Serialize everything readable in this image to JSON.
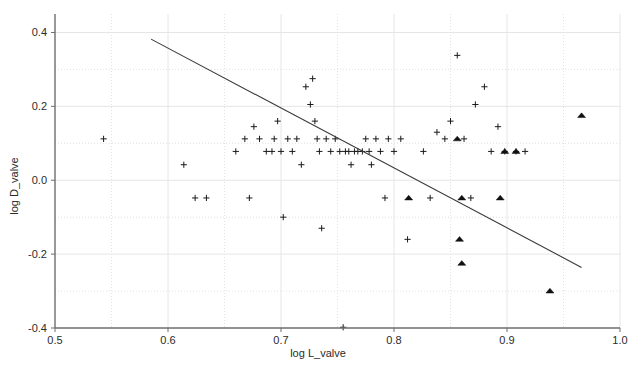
{
  "chart_data": {
    "type": "scatter",
    "title": "",
    "xlabel": "log L_valve",
    "ylabel": "log D_valve",
    "xlim": [
      0.5,
      1.0
    ],
    "ylim": [
      -0.4,
      0.45
    ],
    "grid": true,
    "legend_position": "none",
    "x_ticks": [
      0.5,
      0.6,
      0.7,
      0.8,
      0.9,
      1.0
    ],
    "x_tick_labels": [
      "0.5",
      "0.6",
      "0.7",
      "0.8",
      "0.9",
      "1.0"
    ],
    "y_ticks": [
      -0.4,
      -0.2,
      0.0,
      0.2,
      0.4
    ],
    "y_tick_labels": [
      "-0.4",
      "-0.2",
      "0.0",
      "0.2",
      "0.4"
    ],
    "y_minor_gridlines": [
      -0.3,
      -0.1,
      0.1,
      0.3
    ],
    "x_minor_gridlines": [
      0.55,
      0.65,
      0.75,
      0.85,
      0.95
    ],
    "series": [
      {
        "name": "cross-points",
        "marker": "plus",
        "color": "#1a1a1a",
        "points": [
          [
            0.543,
            0.112
          ],
          [
            0.614,
            0.042
          ],
          [
            0.624,
            -0.048
          ],
          [
            0.634,
            -0.048
          ],
          [
            0.66,
            0.078
          ],
          [
            0.668,
            0.112
          ],
          [
            0.672,
            -0.048
          ],
          [
            0.676,
            0.145
          ],
          [
            0.681,
            0.112
          ],
          [
            0.687,
            0.078
          ],
          [
            0.692,
            0.078
          ],
          [
            0.694,
            0.112
          ],
          [
            0.697,
            0.16
          ],
          [
            0.7,
            0.078
          ],
          [
            0.702,
            -0.1
          ],
          [
            0.706,
            0.112
          ],
          [
            0.71,
            0.078
          ],
          [
            0.714,
            0.112
          ],
          [
            0.718,
            0.042
          ],
          [
            0.722,
            0.253
          ],
          [
            0.726,
            0.205
          ],
          [
            0.728,
            0.275
          ],
          [
            0.73,
            0.16
          ],
          [
            0.732,
            0.112
          ],
          [
            0.734,
            0.078
          ],
          [
            0.736,
            -0.13
          ],
          [
            0.74,
            0.112
          ],
          [
            0.744,
            0.078
          ],
          [
            0.748,
            0.112
          ],
          [
            0.752,
            0.078
          ],
          [
            0.755,
            -0.398
          ],
          [
            0.757,
            0.078
          ],
          [
            0.76,
            0.078
          ],
          [
            0.762,
            0.042
          ],
          [
            0.765,
            0.078
          ],
          [
            0.768,
            0.078
          ],
          [
            0.772,
            0.078
          ],
          [
            0.775,
            0.112
          ],
          [
            0.778,
            0.078
          ],
          [
            0.78,
            0.042
          ],
          [
            0.784,
            0.112
          ],
          [
            0.788,
            0.078
          ],
          [
            0.792,
            -0.048
          ],
          [
            0.795,
            0.112
          ],
          [
            0.8,
            0.078
          ],
          [
            0.806,
            0.112
          ],
          [
            0.812,
            -0.16
          ],
          [
            0.826,
            0.078
          ],
          [
            0.832,
            -0.048
          ],
          [
            0.838,
            0.13
          ],
          [
            0.845,
            0.112
          ],
          [
            0.85,
            0.16
          ],
          [
            0.856,
            0.338
          ],
          [
            0.862,
            0.112
          ],
          [
            0.868,
            -0.048
          ],
          [
            0.872,
            0.205
          ],
          [
            0.88,
            0.253
          ],
          [
            0.886,
            0.078
          ],
          [
            0.892,
            0.145
          ],
          [
            0.898,
            0.078
          ],
          [
            0.908,
            0.078
          ],
          [
            0.916,
            0.078
          ]
        ]
      },
      {
        "name": "triangle-points",
        "marker": "triangle",
        "color": "#111111",
        "points": [
          [
            0.813,
            -0.048
          ],
          [
            0.856,
            0.112
          ],
          [
            0.858,
            -0.16
          ],
          [
            0.86,
            -0.048
          ],
          [
            0.86,
            -0.225
          ],
          [
            0.894,
            -0.048
          ],
          [
            0.898,
            0.078
          ],
          [
            0.908,
            0.078
          ],
          [
            0.938,
            -0.3
          ],
          [
            0.966,
            0.175
          ]
        ]
      }
    ],
    "fit_line": {
      "name": "regression-line",
      "color": "#3a3a3a",
      "x_start": 0.585,
      "y_start": 0.382,
      "x_end": 0.966,
      "y_end": -0.236
    }
  },
  "axes": {
    "x_axis_label": "log L_valve",
    "y_axis_label": "log D_valve"
  }
}
